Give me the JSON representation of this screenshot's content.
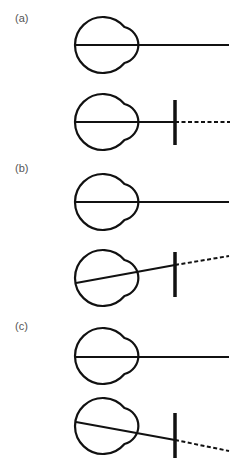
{
  "figure": {
    "panels": [
      {
        "label": "(a)",
        "label_y": 12,
        "rows": [
          {
            "eye_center": [
              103,
              45
            ],
            "axis": {
              "start": [
                76,
                45
              ],
              "end": [
                229,
                45
              ]
            },
            "bar": null,
            "dashed": null
          },
          {
            "eye_center": [
              103,
              122
            ],
            "axis": {
              "start": [
                76,
                122
              ],
              "end": [
                175,
                122
              ]
            },
            "bar": {
              "x": 175,
              "y1": 100,
              "y2": 145
            },
            "dashed": {
              "start": [
                175,
                122
              ],
              "end": [
                230,
                122
              ]
            }
          }
        ]
      },
      {
        "label": "(b)",
        "label_y": 162,
        "rows": [
          {
            "eye_center": [
              103,
              202
            ],
            "axis": {
              "start": [
                76,
                202
              ],
              "end": [
                229,
                202
              ]
            },
            "bar": null,
            "dashed": null
          },
          {
            "eye_center": [
              103,
              278
            ],
            "axis": {
              "start": [
                76,
                283
              ],
              "end": [
                175,
                265
              ]
            },
            "bar": {
              "x": 175,
              "y1": 252,
              "y2": 297
            },
            "dashed": {
              "start": [
                175,
                265
              ],
              "end": [
                229,
                256
              ]
            }
          }
        ]
      },
      {
        "label": "(c)",
        "label_y": 320,
        "rows": [
          {
            "eye_center": [
              103,
              356
            ],
            "axis": {
              "start": [
                76,
                357
              ],
              "end": [
                229,
                357
              ]
            },
            "bar": null,
            "dashed": null
          },
          {
            "eye_center": [
              103,
              426
            ],
            "axis": {
              "start": [
                76,
                422
              ],
              "end": [
                175,
                440
              ]
            },
            "bar": {
              "x": 175,
              "y1": 413,
              "y2": 458
            },
            "dashed": {
              "start": [
                175,
                440
              ],
              "end": [
                229,
                451
              ]
            }
          }
        ]
      }
    ],
    "colors": {
      "stroke": "#111111",
      "label": "#555555",
      "background": "#ffffff"
    }
  }
}
